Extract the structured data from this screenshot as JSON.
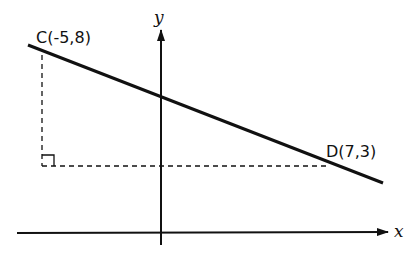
{
  "diagram": {
    "type": "coordinate-geometry",
    "points": [
      {
        "name": "C",
        "label": "C(-5,8)",
        "x": -5,
        "y": 8
      },
      {
        "name": "D",
        "label": "D(7,3)",
        "x": 7,
        "y": 3
      }
    ],
    "axes": {
      "x_label": "x",
      "y_label": "y"
    },
    "elements": {
      "line": "straight line through C and D extending beyond both points",
      "dashed_vertical": "from C down to the level of D",
      "dashed_horizontal": "from the foot below C across to D",
      "right_angle_marker": "at the corner below C, level with D"
    },
    "colors": {
      "ink": "#111111",
      "background": "#ffffff"
    }
  }
}
